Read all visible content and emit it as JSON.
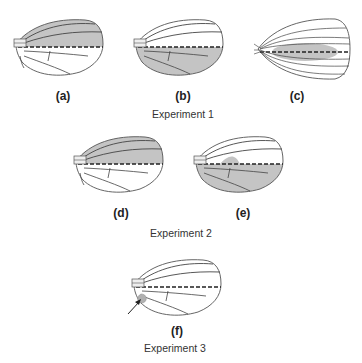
{
  "figure": {
    "experiments": [
      {
        "caption": "Experiment 1",
        "panels": [
          {
            "label": "(a)",
            "wing_type": "normal",
            "shaded_region": "anterior"
          },
          {
            "label": "(b)",
            "wing_type": "normal",
            "shaded_region": "posterior"
          },
          {
            "label": "(c)",
            "wing_type": "symmetric",
            "shaded_region": "central"
          }
        ]
      },
      {
        "caption": "Experiment 2",
        "panels": [
          {
            "label": "(d)",
            "wing_type": "normal",
            "shaded_region": "anterior"
          },
          {
            "label": "(e)",
            "wing_type": "normal",
            "shaded_region": "posterior-extended"
          }
        ]
      },
      {
        "caption": "Experiment 3",
        "panels": [
          {
            "label": "(f)",
            "wing_type": "normal",
            "shaded_region": "small-spot",
            "annotation": "arrow"
          }
        ]
      }
    ],
    "colors": {
      "shade": "#c4c4c4",
      "outline": "#555555",
      "vein": "#444444",
      "dashed": "#222222"
    }
  }
}
